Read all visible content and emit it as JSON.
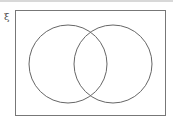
{
  "diagram": {
    "type": "venn",
    "universal_symbol": "ξ",
    "sets": [
      {
        "name": "left-circle",
        "cx": 68,
        "cy": 64,
        "r": 39
      },
      {
        "name": "right-circle",
        "cx": 113,
        "cy": 64,
        "r": 39
      }
    ],
    "stroke_color": "#666666"
  }
}
